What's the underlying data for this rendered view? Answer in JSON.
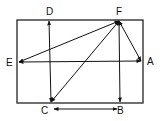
{
  "diagram": {
    "type": "rectangle-with-vectors",
    "stroke_color": "#111111",
    "background": "#ffffff",
    "rectangle": {
      "x": 17,
      "y": 20,
      "width": 126,
      "height": 83
    },
    "points": {
      "A": {
        "label": "A",
        "x": 141,
        "y": 61
      },
      "B": {
        "label": "B",
        "x": 120,
        "y": 102
      },
      "C": {
        "label": "C",
        "x": 51,
        "y": 102
      },
      "D": {
        "label": "D",
        "x": 49,
        "y": 21
      },
      "E": {
        "label": "E",
        "x": 19,
        "y": 62
      },
      "F": {
        "label": "F",
        "x": 119,
        "y": 21
      }
    },
    "labels": [
      {
        "id": "A",
        "text": "A",
        "x": 147,
        "y": 65
      },
      {
        "id": "B",
        "text": "B",
        "x": 117,
        "y": 114
      },
      {
        "id": "C",
        "text": "C",
        "x": 41,
        "y": 114
      },
      {
        "id": "D",
        "text": "D",
        "x": 46,
        "y": 15
      },
      {
        "id": "E",
        "text": "E",
        "x": 6,
        "y": 66
      },
      {
        "id": "F",
        "text": "F",
        "x": 116,
        "y": 15
      }
    ],
    "arrows": [
      {
        "from": "D",
        "to": "C",
        "double": true
      },
      {
        "from": "E",
        "to": "A",
        "double": true
      },
      {
        "from": "F",
        "to": "E",
        "double": true
      },
      {
        "from": "F",
        "to": "C",
        "double": true
      },
      {
        "from": "F",
        "to": "A",
        "double": true
      },
      {
        "from": "F",
        "to": "B",
        "double": true
      },
      {
        "from": "C",
        "to": "B",
        "double": true,
        "offset_below": true
      }
    ]
  }
}
